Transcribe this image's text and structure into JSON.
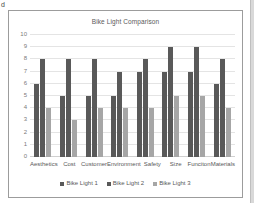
{
  "document": {
    "stray_text": "d"
  },
  "chart": {
    "title": "Bike Light Comparison"
  },
  "colors": {
    "series1": "#595959",
    "series2": "#595959",
    "series3": "#a6a6a6",
    "gridline": "#e4e4e4",
    "frame": "#9c9c9c",
    "text": "#595959",
    "tick_text": "#7a7a7a"
  },
  "chart_data": {
    "type": "bar",
    "title": "Bike Light Comparison",
    "xlabel": "",
    "ylabel": "",
    "ylim": [
      0,
      10
    ],
    "ytick_step": 1,
    "yticks": [
      "10",
      "9",
      "8",
      "7",
      "6",
      "5",
      "4",
      "3",
      "2",
      "1",
      "0"
    ],
    "grid": true,
    "legend_position": "bottom",
    "categories": [
      "Aesthetics",
      "Cost",
      "Customer",
      "Environment",
      "Safety",
      "Size",
      "Funciton",
      "Materials"
    ],
    "series": [
      {
        "name": "Bike Light 1",
        "values": [
          6,
          5,
          5,
          5,
          7,
          7,
          7,
          6
        ]
      },
      {
        "name": "Bike Light 2",
        "values": [
          8,
          8,
          8,
          7,
          8,
          9,
          9,
          8
        ]
      },
      {
        "name": "Bike Light 3",
        "values": [
          4,
          3,
          4,
          4,
          4,
          5,
          5,
          4
        ]
      }
    ]
  }
}
